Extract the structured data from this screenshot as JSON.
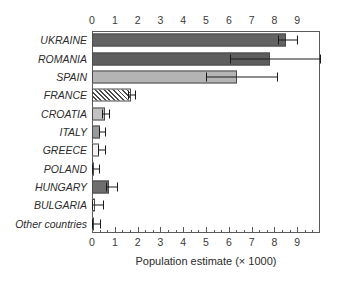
{
  "chart_data": {
    "type": "bar",
    "orientation": "horizontal",
    "title": "",
    "xlabel": "Population estimate (× 1000)",
    "ylabel": "",
    "xlim": [
      0,
      10
    ],
    "grid": false,
    "legend": "none",
    "axis_top": true,
    "axis_bottom": true,
    "xticks": [
      0,
      1,
      2,
      3,
      4,
      5,
      6,
      7,
      8,
      9
    ],
    "xtick_labels": [
      "0",
      "1",
      "2",
      "3",
      "4",
      "5",
      "6",
      "7",
      "8",
      "9"
    ],
    "minor_ticks_per_interval": 2,
    "categories": [
      "UKRAINE",
      "ROMANIA",
      "SPAIN",
      "FRANCE",
      "CROATIA",
      "ITALY",
      "GREECE",
      "POLAND",
      "HUNGARY",
      "BULGARIA",
      "Other countries"
    ],
    "values": [
      8.5,
      7.8,
      6.35,
      1.7,
      0.55,
      0.35,
      0.3,
      0.05,
      0.75,
      0.15,
      0.05
    ],
    "error_low": [
      8.15,
      6.05,
      5.0,
      1.6,
      0.45,
      0.3,
      0.25,
      0.0,
      0.6,
      0.0,
      0.0
    ],
    "error_high": [
      9.0,
      10.0,
      8.1,
      1.9,
      0.75,
      0.55,
      0.55,
      0.3,
      1.1,
      0.5,
      0.35
    ],
    "bar_fills": [
      "#636363",
      "#5e5e5e",
      "#b4b4b4",
      "hatch",
      "#c2c2c2",
      "#9a9a9a",
      "#f2f2f2",
      "#8a8a8a",
      "#6e6e6e",
      "#fbfbfb",
      "#ffffff"
    ],
    "series": [
      {
        "name": "Population estimate",
        "values": [
          8.5,
          7.8,
          6.35,
          1.7,
          0.55,
          0.35,
          0.3,
          0.05,
          0.75,
          0.15,
          0.05
        ]
      }
    ]
  },
  "colors": {
    "axis": "#5a5a5a",
    "text": "#2b2b2b",
    "bar_edge": "#4a4a4a",
    "error_bar": "#1a1a1a",
    "background": "#ffffff"
  }
}
